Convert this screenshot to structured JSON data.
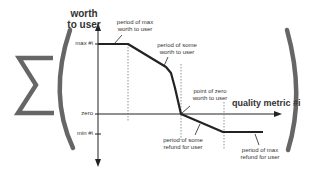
{
  "diagram": {
    "sum_symbol": "∑",
    "y_axis": {
      "title_line1": "worth",
      "title_line2": "to user"
    },
    "x_axis": {
      "title": "quality metric #i"
    },
    "ticks": {
      "max": "max #i",
      "zero": "zero",
      "min": "min #i"
    },
    "annotations": {
      "max_worth": {
        "line1": "period of max",
        "line2": "worth to user"
      },
      "some_worth": {
        "line1": "period of some",
        "line2": "worth to user"
      },
      "zero_worth": {
        "line1": "point of zero",
        "line2": "worth to user"
      },
      "some_refund": {
        "line1": "period of some",
        "line2": "refund for user"
      },
      "max_refund": {
        "line1": "period of max",
        "line2": "refund for user"
      }
    },
    "colors": {
      "curve": "#222222",
      "axis": "#222222",
      "bracket": "#555555",
      "text": "#333333"
    }
  }
}
